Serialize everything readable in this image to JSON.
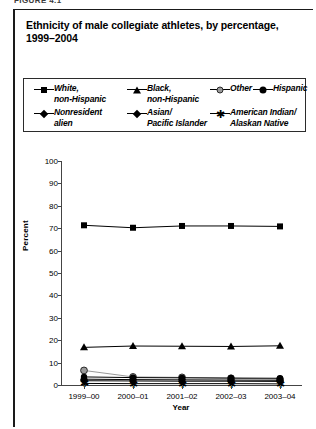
{
  "figure_label": "FIGURE 4.1",
  "title": "Ethnicity of male collegiate athletes, by percentage, 1999–2004",
  "legend": {
    "items": [
      {
        "label": "White,\nnon-Hispanic",
        "marker": "square-marker",
        "color": "#000000"
      },
      {
        "label": "Black,\nnon-Hispanic",
        "marker": "triangle-marker",
        "color": "#000000"
      },
      {
        "label": "Other",
        "marker": "circle-open-marker",
        "color": "#9a9a9a"
      },
      {
        "label": "Hispanic",
        "marker": "circle-filled-marker",
        "color": "#000000"
      },
      {
        "label": "Nonresident\nalien",
        "marker": "diamond-marker",
        "color": "#000000"
      },
      {
        "label": "Asian/\nPacific Islander",
        "marker": "diamond-marker",
        "color": "#000000"
      },
      {
        "label": "American Indian/\nAlaskan Native",
        "marker": "star-marker",
        "color": "#000000"
      }
    ]
  },
  "chart_data": {
    "type": "line",
    "title": "Ethnicity of male collegiate athletes, by percentage, 1999–2004",
    "xlabel": "Year",
    "ylabel": "Percent",
    "categories": [
      "1999–00",
      "2000–01",
      "2001–02",
      "2002–03",
      "2003–04"
    ],
    "ylim": [
      0,
      100
    ],
    "ytick_values": [
      0,
      10,
      20,
      30,
      40,
      50,
      60,
      70,
      80,
      90,
      100
    ],
    "grid": false,
    "legend_position": "top",
    "series": [
      {
        "name": "White, non-Hispanic",
        "marker": "square-marker",
        "color": "#000000",
        "values": [
          71.3,
          70.2,
          71.0,
          71.0,
          70.8
        ]
      },
      {
        "name": "Black, non-Hispanic",
        "marker": "triangle-marker",
        "color": "#000000",
        "values": [
          16.8,
          17.4,
          17.3,
          17.2,
          17.5
        ]
      },
      {
        "name": "Other",
        "marker": "circle-open-marker",
        "color": "#9a9a9a",
        "values": [
          6.5,
          3.6,
          3.4,
          3.0,
          2.6
        ]
      },
      {
        "name": "Hispanic",
        "marker": "circle-filled-marker",
        "color": "#000000",
        "values": [
          3.6,
          3.3,
          3.2,
          3.1,
          3.0
        ]
      },
      {
        "name": "Nonresident alien",
        "marker": "diamond-marker",
        "color": "#000000",
        "values": [
          2.6,
          2.4,
          2.3,
          2.2,
          2.1
        ]
      },
      {
        "name": "Asian/Pacific Islander",
        "marker": "diamond-marker",
        "color": "#000000",
        "values": [
          1.9,
          1.8,
          1.7,
          1.7,
          1.6
        ]
      },
      {
        "name": "American Indian/Alaskan Native",
        "marker": "star-marker",
        "color": "#000000",
        "values": [
          0.7,
          0.6,
          0.6,
          0.6,
          0.5
        ]
      }
    ]
  }
}
